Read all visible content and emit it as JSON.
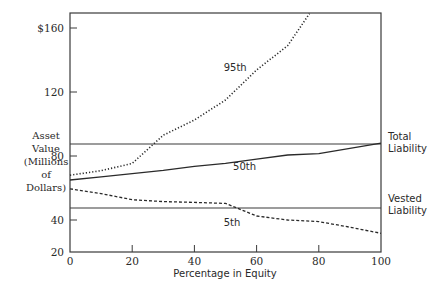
{
  "chart_data": {
    "type": "line",
    "title": "",
    "xlabel": "Percentage in Equity",
    "ylabel": [
      "Asset",
      "Value",
      "(Millions",
      "of",
      "Dollars)"
    ],
    "xlim": [
      0,
      100
    ],
    "ylim": [
      20,
      169
    ],
    "x_ticks": [
      "0",
      "20",
      "40",
      "60",
      "80",
      "100"
    ],
    "y_ticks": [
      {
        "value": 160,
        "label": "$160"
      },
      {
        "value": 120,
        "label": "120"
      },
      {
        "value": 80,
        "label": "80"
      },
      {
        "value": 40,
        "label": "40"
      },
      {
        "value": 20,
        "label": "20"
      }
    ],
    "grid": false,
    "reference_lines": [
      {
        "name": "Total Liability",
        "label_lines": [
          "Total",
          "Liability"
        ],
        "value": 87.5
      },
      {
        "name": "Vested Liability",
        "label_lines": [
          "Vested",
          "Liability"
        ],
        "value": 47.5
      }
    ],
    "series": [
      {
        "name": "95th",
        "style": "dotted",
        "x": [
          0,
          10,
          20,
          30,
          40,
          50,
          60,
          70,
          77
        ],
        "values": [
          68,
          70.8,
          75.4,
          93,
          102.5,
          115,
          133.75,
          149,
          169
        ]
      },
      {
        "name": "50th",
        "style": "solid",
        "x": [
          0,
          10,
          20,
          30,
          40,
          50,
          60,
          70,
          80,
          90,
          100
        ],
        "values": [
          65,
          67,
          69,
          71,
          73.5,
          75.4,
          78,
          80.6,
          81.5,
          84.8,
          88
        ]
      },
      {
        "name": "5th",
        "style": "dashed",
        "x": [
          0,
          10,
          20,
          30,
          40,
          50,
          60,
          70,
          80,
          90,
          100
        ],
        "values": [
          59.5,
          56.5,
          52.7,
          51.5,
          51,
          50.4,
          42.5,
          40,
          39,
          35.5,
          31.7
        ]
      }
    ],
    "series_labels": [
      {
        "text": "95th",
        "x": 52,
        "y": 135
      },
      {
        "text": "50th",
        "x": 55,
        "y": 73
      },
      {
        "text": "5th",
        "x": 52,
        "y": 38
      }
    ]
  }
}
